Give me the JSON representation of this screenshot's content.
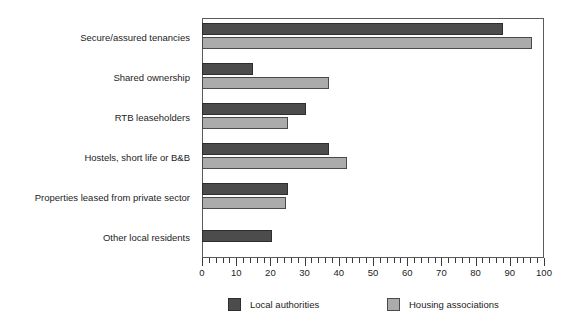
{
  "chart_data": {
    "type": "bar",
    "orientation": "horizontal",
    "title": "",
    "xlabel": "",
    "ylabel": "",
    "xlim": [
      0,
      100
    ],
    "grid": false,
    "legend_position": "bottom",
    "x_major_step": 10,
    "x_minor_step": 2,
    "categories": [
      "Secure/assured tenancies",
      "Shared ownership",
      "RTB leaseholders",
      "Hostels, short life or B&B",
      "Properties leased from private sector",
      "Other local residents"
    ],
    "tick_labels": [
      "0",
      "10",
      "20",
      "30",
      "40",
      "50",
      "60",
      "70",
      "80",
      "90",
      "100"
    ],
    "tick_values": [
      0,
      10,
      20,
      30,
      40,
      50,
      60,
      70,
      80,
      90,
      100
    ],
    "series": [
      {
        "name": "Local authorities",
        "color": "#4c4c4c",
        "values": [
          88,
          15,
          30.5,
          37,
          25,
          20.5
        ]
      },
      {
        "name": "Housing associations",
        "color": "#ababab",
        "values": [
          96.5,
          37,
          25,
          42.5,
          24.5,
          null
        ]
      }
    ]
  }
}
